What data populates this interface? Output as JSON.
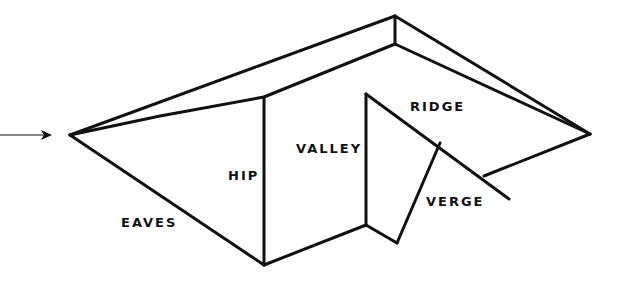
{
  "diagram": {
    "line_color": "#111111",
    "labels": {
      "eaves": "EAVES",
      "hip": "HIP",
      "valley": "VALLEY",
      "ridge": "RIDGE",
      "verge": "VERGE"
    },
    "pointer": "arrow-right"
  }
}
